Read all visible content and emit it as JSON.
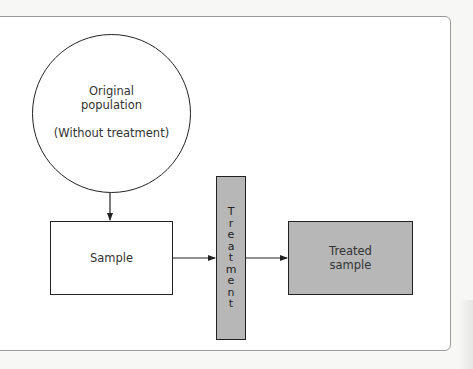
{
  "diagram": {
    "nodes": {
      "population": {
        "line1": "Original",
        "line2": "population",
        "line3": "(Without treatment)"
      },
      "sample": {
        "label": "Sample"
      },
      "treatment": {
        "label": "Treatment",
        "letters": [
          "T",
          "r",
          "e",
          "a",
          "t",
          "m",
          "e",
          "n",
          "t"
        ]
      },
      "treated_sample": {
        "line1": "Treated",
        "line2": "sample"
      }
    },
    "edges": [
      {
        "from": "population",
        "to": "sample"
      },
      {
        "from": "sample",
        "to": "treatment"
      },
      {
        "from": "treatment",
        "to": "treated_sample"
      }
    ],
    "colors": {
      "treatment_fill": "#b7b7b7",
      "treated_fill": "#b7b7b7",
      "stroke": "#222222",
      "frame": "#9a9a9a"
    }
  }
}
